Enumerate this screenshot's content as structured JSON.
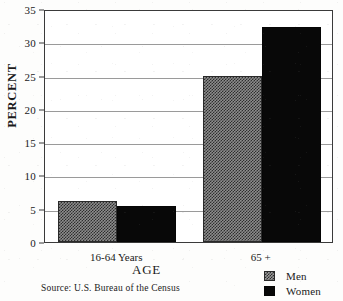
{
  "chart_data": {
    "type": "bar",
    "title": "",
    "subtitle": "",
    "xlabel": "AGE",
    "ylabel": "PERCENT",
    "categories": [
      "16-64 Years",
      "65 +"
    ],
    "series": [
      {
        "name": "Men",
        "values": [
          6.2,
          25.0
        ]
      },
      {
        "name": "Women",
        "values": [
          5.4,
          32.3
        ]
      }
    ],
    "ylim": [
      0,
      35
    ],
    "yticks": [
      0,
      5,
      10,
      15,
      20,
      25,
      30,
      35
    ],
    "ytick_labels": [
      "0",
      "5",
      "10",
      "15",
      "20",
      "25",
      "30",
      "35"
    ],
    "grid": true,
    "grid_axis": "y",
    "legend_position": "bottom-right",
    "legend_entries": [
      "Men",
      "Women"
    ],
    "annotations": [
      "Source:  U.S. Bureau of the Census"
    ],
    "colors": {
      "men_fill": "#8d8d8d",
      "men_pattern": "#2e2e2e",
      "women_fill": "#080808",
      "axis": "#3a3a3a",
      "gridline": "#9a9a9a",
      "background": "#ffffff"
    }
  },
  "source_note": "Source:  U.S. Bureau of the Census",
  "legend": {
    "items": [
      {
        "label": "Men",
        "swatch": "checkerboard-swatch-icon"
      },
      {
        "label": "Women",
        "swatch": "solid-black-swatch-icon"
      }
    ]
  }
}
